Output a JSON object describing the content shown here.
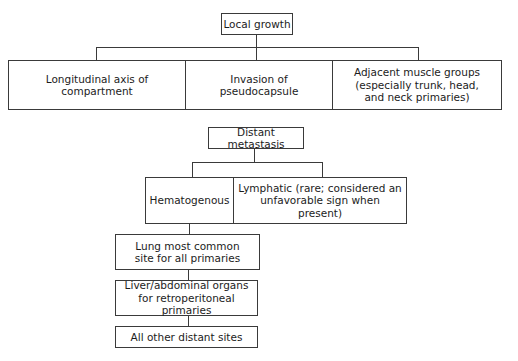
{
  "local_growth": {
    "title": "Local growth",
    "children": [
      "Longitudinal axis of compartment",
      "Invasion of pseudocapsule",
      "Adjacent muscle groups (especially trunk, head, and neck primaries)"
    ]
  },
  "distant_metastasis": {
    "title": "Distant metastasis",
    "children": [
      "Hematogenous",
      "Lymphatic (rare; considered an unfavorable sign when present)"
    ],
    "hematogenous_sites": [
      "Lung most common site for all primaries",
      "Liver/abdominal organs for retroperitoneal primaries",
      "All other distant sites"
    ]
  },
  "colors": {
    "line": "#3a3a3a",
    "text": "#1c1c1c",
    "background": "#ffffff"
  }
}
